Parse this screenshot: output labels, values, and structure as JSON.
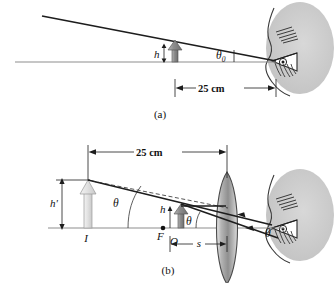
{
  "figure": {
    "panels": [
      {
        "id": "a",
        "caption": "(a)",
        "labels": {
          "object_height": "h",
          "angle": "θ",
          "angle_subscript": "0",
          "distance": "25 cm"
        },
        "elements": {
          "eye": "eye-profile",
          "object_arrow": "object-arrow",
          "ray": "chief-ray",
          "axis": "optical-axis",
          "dimension": "near-point-dimension"
        }
      },
      {
        "id": "b",
        "caption": "(b)",
        "labels": {
          "image_height": "h'",
          "object_height": "h",
          "angle": "θ",
          "image_point": "I",
          "focal_point": "F",
          "object_point": "O",
          "object_distance": "s",
          "distance": "25 cm"
        },
        "elements": {
          "eye": "eye-profile",
          "lens": "converging-lens",
          "image_arrow": "image-arrow",
          "object_arrow": "object-arrow",
          "axis": "optical-axis",
          "dimension_top": "near-point-dimension",
          "dimension_bottom": "object-distance-dimension",
          "solid_ray": "refracted-ray",
          "dashed_ray": "virtual-ray"
        }
      }
    ],
    "colors": {
      "ink": "#1d1d1d",
      "axis_gray": "#8d8d8d",
      "object_fill": "#9a9a9a",
      "image_fill": "#dcdcdc",
      "lens_fill": "#a8a8a8",
      "skin_fill": "#c9c9c9",
      "background": "#ffffff"
    }
  }
}
